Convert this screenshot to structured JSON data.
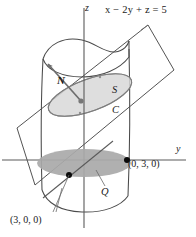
{
  "figure": {
    "labels": {
      "plane_equation": "x − 2y + z = 5",
      "z_axis": "z",
      "y_axis": "y",
      "normal_vector": "N",
      "surface": "S",
      "curve": "C",
      "region": "Q",
      "point_y": "(0, 3, 0)",
      "point_x": "(3, 0, 0)"
    },
    "colors": {
      "stroke": "#3a3a3a",
      "axis": "#555555",
      "surface_fill": "#d9d9d9",
      "region_fill": "#a8a8a8",
      "point": "#000000",
      "background": "#ffffff"
    },
    "geometry": {
      "axes": [
        "z",
        "y"
      ],
      "shapes": [
        "cylinder",
        "plane",
        "ellipse-surface-S",
        "curve-C",
        "region-Q",
        "normal-vector-N"
      ],
      "points_marked": 2
    }
  }
}
